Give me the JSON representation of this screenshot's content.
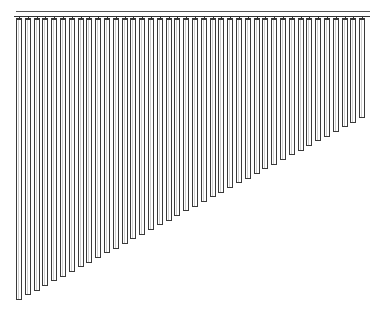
{
  "image": {
    "subject": "vertical blinds",
    "description": "Line drawing of vertical window blinds with a top headrail and slats decreasing in length diagonally from left to right"
  },
  "headrail": {
    "x_start": 16,
    "x_end": 370,
    "top_line_y": 11,
    "bottom_line_y": 16,
    "color": "#333333"
  },
  "slats": {
    "count": 40,
    "first_x": 16,
    "spacing": 8.8,
    "width": 6,
    "top_y": 19,
    "first_bottom_y": 300,
    "last_bottom_y": 118,
    "stroke_color": "#3a3a3a",
    "fill_color": "#ffffff"
  }
}
